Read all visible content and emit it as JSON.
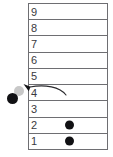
{
  "diagram": {
    "colors": {
      "border": "#6e6e72",
      "token": "#111114",
      "ghost_token": "#c8c8c8",
      "label": "#3a3a3e",
      "background": "#ffffff",
      "arrow": "#2a2a2e"
    },
    "table": {
      "name": "numbered-slot-column",
      "row_count": 9,
      "rows": [
        {
          "label": "9",
          "has_token": false
        },
        {
          "label": "8",
          "has_token": false
        },
        {
          "label": "7",
          "has_token": false
        },
        {
          "label": "6",
          "has_token": false
        },
        {
          "label": "5",
          "has_token": false
        },
        {
          "label": "4",
          "has_token": false
        },
        {
          "label": "3",
          "has_token": false
        },
        {
          "label": "2",
          "has_token": true
        },
        {
          "label": "1",
          "has_token": true
        }
      ]
    },
    "free_tokens": [
      {
        "name": "ejected-token",
        "state": "solid"
      },
      {
        "name": "ghost-token",
        "state": "faded"
      }
    ],
    "arrow": {
      "name": "motion-arrow",
      "from_row_label": "4",
      "direction": "left",
      "style": "curved"
    }
  }
}
